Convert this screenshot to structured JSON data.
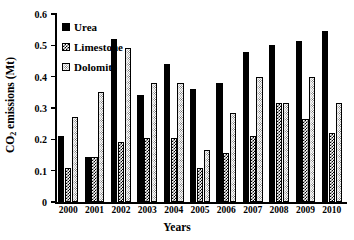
{
  "chart_data": {
    "type": "bar",
    "title": "",
    "xlabel": "Years",
    "ylabel": "CO2 emissions (Mt)",
    "ylabel_parts": {
      "prefix": "CO",
      "sub": "2",
      "suffix": " emissions (Mt)"
    },
    "categories": [
      "2000",
      "2001",
      "2002",
      "2003",
      "2004",
      "2005",
      "2006",
      "2007",
      "2008",
      "2009",
      "2010"
    ],
    "series": [
      {
        "name": "Urea",
        "fill": "solid-black",
        "values": [
          0.21,
          0.145,
          0.52,
          0.34,
          0.44,
          0.36,
          0.38,
          0.48,
          0.5,
          0.515,
          0.545
        ]
      },
      {
        "name": "Limestone",
        "fill": "crosshatch",
        "values": [
          0.11,
          0.145,
          0.19,
          0.205,
          0.205,
          0.11,
          0.155,
          0.21,
          0.315,
          0.265,
          0.22
        ]
      },
      {
        "name": "Dolomite",
        "fill": "fine-dotted",
        "values": [
          0.27,
          0.35,
          0.49,
          0.38,
          0.38,
          0.165,
          0.285,
          0.4,
          0.315,
          0.4,
          0.315
        ]
      }
    ],
    "ylim": [
      0,
      0.6
    ],
    "yticks": [
      0,
      0.1,
      0.2,
      0.3,
      0.4,
      0.5,
      0.6
    ],
    "ytick_labels": [
      "0",
      "0.1",
      "0.2",
      "0.3",
      "0.4",
      "0.5",
      "0.6"
    ],
    "grid": false,
    "legend_position": "top-left",
    "colors": {
      "urea": "#000000",
      "limestone": "#000000",
      "dolomite": "#555555",
      "axis": "#000000",
      "background": "#ffffff"
    }
  }
}
